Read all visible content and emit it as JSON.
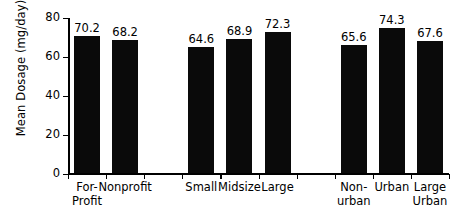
{
  "chart_data": {
    "type": "bar",
    "title": "",
    "subtitle": "",
    "xlabel": "",
    "ylabel": "Mean Dosage (mg/day)",
    "ylim": [
      0,
      80
    ],
    "yticks": [
      0,
      20,
      40,
      60,
      80
    ],
    "ytick_labels": [
      "0",
      "20",
      "40",
      "60",
      "80"
    ],
    "grid": false,
    "legend": null,
    "bar_color": "#0a0a0a",
    "axis_color": "#000000",
    "groups": [
      {
        "name": "ownership",
        "categories": [
          "For-\nProfit",
          "Nonprofit"
        ],
        "values": [
          70.2,
          68.2
        ],
        "value_labels": [
          "70.2",
          "68.2"
        ]
      },
      {
        "name": "size",
        "categories": [
          "Small",
          "Midsize",
          "Large"
        ],
        "values": [
          64.6,
          68.9,
          72.3
        ],
        "value_labels": [
          "64.6",
          "68.9",
          "72.3"
        ]
      },
      {
        "name": "location",
        "categories": [
          "Non-\nurban",
          "Urban",
          "Large\nUrban"
        ],
        "values": [
          65.6,
          74.3,
          67.6
        ],
        "value_labels": [
          "65.6",
          "74.3",
          "67.6"
        ]
      }
    ],
    "categories": [
      "For-\nProfit",
      "Nonprofit",
      "Small",
      "Midsize",
      "Large",
      "Non-\nurban",
      "Urban",
      "Large\nUrban"
    ],
    "values": [
      70.2,
      68.2,
      64.6,
      68.9,
      72.3,
      65.6,
      74.3,
      67.6
    ],
    "slots": [
      {
        "label": "For-\nProfit",
        "value": 70.2,
        "value_label": "70.2",
        "slot": 0
      },
      {
        "label": "Nonprofit",
        "value": 68.2,
        "value_label": "68.2",
        "slot": 1
      },
      {
        "label": "",
        "value": null,
        "value_label": "",
        "slot": 2
      },
      {
        "label": "Small",
        "value": 64.6,
        "value_label": "64.6",
        "slot": 3
      },
      {
        "label": "Midsize",
        "value": 68.9,
        "value_label": "68.9",
        "slot": 4
      },
      {
        "label": "Large",
        "value": 72.3,
        "value_label": "72.3",
        "slot": 5
      },
      {
        "label": "",
        "value": null,
        "value_label": "",
        "slot": 6
      },
      {
        "label": "Non-\nurban",
        "value": 65.6,
        "value_label": "65.6",
        "slot": 7
      },
      {
        "label": "Urban",
        "value": 74.3,
        "value_label": "74.3",
        "slot": 8
      },
      {
        "label": "Large\nUrban",
        "value": 67.6,
        "value_label": "67.6",
        "slot": 9
      }
    ]
  }
}
